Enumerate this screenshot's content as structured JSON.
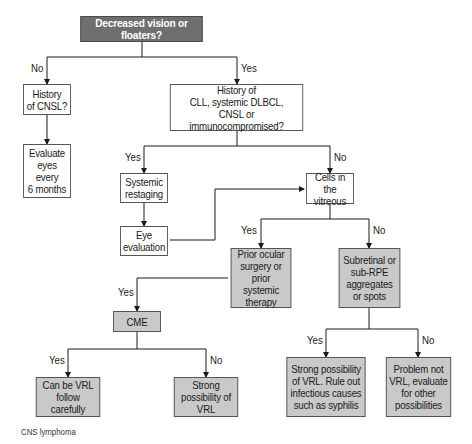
{
  "diagram": {
    "type": "flowchart",
    "caption": "CNS lymphoma",
    "colors": {
      "start_fill": "#6f6f6f",
      "decision_fill_grey": "#c9c9c9",
      "plain_fill": "#ffffff",
      "line": "#1a1a1a"
    },
    "nodes": {
      "start": "Decreased vision or floaters?",
      "history_cnsl": "History\nof CNSL?",
      "evaluate_eyes": "Evaluate\neyes\nevery\n6 months",
      "history_cll": "History of\nCLL, systemic DLBCL,\nCNSL or immunocompromised?",
      "systemic_restaging": "Systemic\nrestaging",
      "eye_evaluation": "Eye\nevaluation",
      "cells_vitreous": "Cells in the\nvitreous",
      "prior_ocular": "Prior ocular\nsurgery or\nprior systemic\ntherapy",
      "subretinal": "Subretinal or\nsub-RPE\naggregates\nor spots",
      "cme": "CME",
      "can_be_vrl": "Can be VRL\nfollow carefully",
      "strong_vrl": "Strong\npossibility of\nVRL",
      "strong_rule_out": "Strong possibility\nof VRL. Rule out\ninfectious causes\nsuch as syphilis",
      "problem_not_vrl": "Problem not\nVRL, evaluate\nfor other\npossibilities"
    },
    "edge_labels": {
      "start_no": "No",
      "start_yes": "Yes",
      "cll_yes": "Yes",
      "cll_no": "No",
      "cells_yes": "Yes",
      "cells_no": "No",
      "prior_yes": "Yes",
      "cme_yes": "Yes",
      "cme_no": "No",
      "sub_yes": "Yes",
      "sub_no": "No"
    },
    "edges": [
      [
        "start",
        "history_cnsl",
        "No"
      ],
      [
        "start",
        "history_cll",
        "Yes"
      ],
      [
        "history_cnsl",
        "evaluate_eyes",
        ""
      ],
      [
        "history_cll",
        "systemic_restaging",
        "Yes"
      ],
      [
        "history_cll",
        "cells_vitreous",
        "No"
      ],
      [
        "systemic_restaging",
        "eye_evaluation",
        ""
      ],
      [
        "eye_evaluation",
        "cells_vitreous",
        ""
      ],
      [
        "cells_vitreous",
        "prior_ocular",
        "Yes"
      ],
      [
        "cells_vitreous",
        "subretinal",
        "No"
      ],
      [
        "prior_ocular",
        "cme",
        "Yes"
      ],
      [
        "cme",
        "can_be_vrl",
        "Yes"
      ],
      [
        "cme",
        "strong_vrl",
        "No"
      ],
      [
        "subretinal",
        "strong_rule_out",
        "Yes"
      ],
      [
        "subretinal",
        "problem_not_vrl",
        "No"
      ]
    ]
  }
}
